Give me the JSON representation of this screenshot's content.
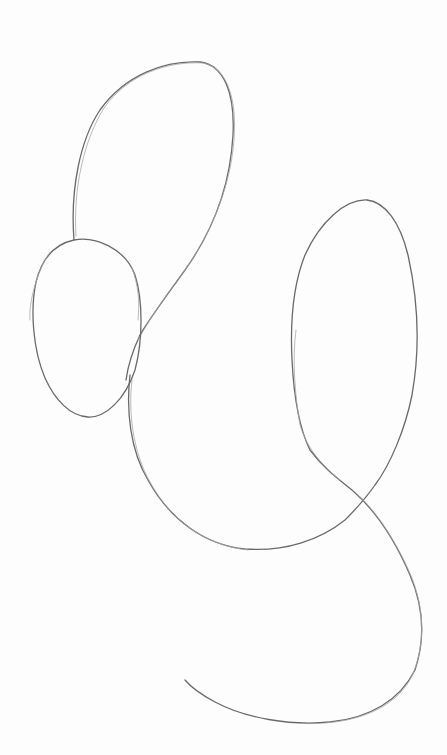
{
  "image": {
    "description": "Pencil sketch of loose looping curves on white paper",
    "medium": "graphite pencil",
    "background_color": "#ffffff",
    "line_color": "#6a6a6a"
  },
  "shapes": [
    {
      "name": "upper-loop",
      "description": "Tall elongated loop at top-center"
    },
    {
      "name": "small-left-oval",
      "description": "Small egg-shaped oval on the left"
    },
    {
      "name": "right-tall-loop",
      "description": "Tall narrow loop on the right"
    },
    {
      "name": "lower-swoop",
      "description": "Long S-shaped curve sweeping down and across the bottom"
    }
  ]
}
